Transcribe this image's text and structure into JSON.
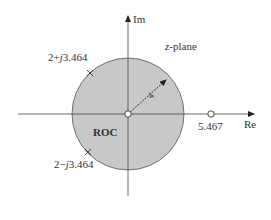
{
  "diagram": {
    "title": "z-plane",
    "title_prefix": "z",
    "title_suffix": "-plane",
    "axes": {
      "real_label": "Re",
      "imag_label": "Im"
    },
    "region": {
      "label": "ROC",
      "radius_label": "4",
      "fill_color": "#c8c8c8"
    },
    "poles": [
      {
        "label": "2+j3.464",
        "re_part": "2+",
        "j": "j",
        "im_part": "3.464"
      },
      {
        "label": "2−j3.464",
        "re_part": "2−",
        "j": "j",
        "im_part": "3.464"
      }
    ],
    "zeros": [
      {
        "label": "5.467"
      },
      {
        "label": "origin"
      }
    ]
  }
}
